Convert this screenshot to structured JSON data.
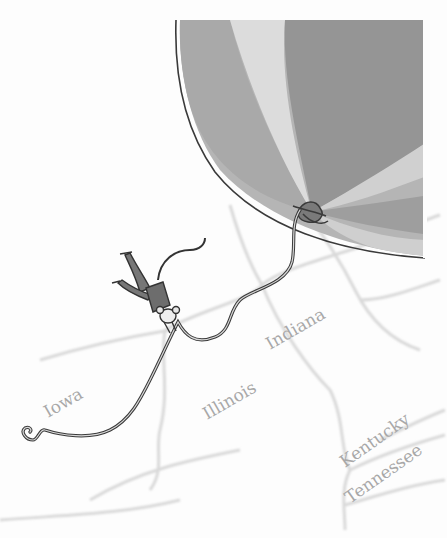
{
  "illustration": {
    "subject": "mouse hanging from a balloon string floating over a map",
    "colors": {
      "balloon_dark": "#8e8e8e",
      "balloon_mid": "#a9a9a9",
      "balloon_light": "#d2d2d2",
      "outline": "#3a3a3a",
      "map_line": "#d8d8d8",
      "label": "#a8a8a8"
    }
  },
  "map": {
    "labels": [
      {
        "name": "Iowa"
      },
      {
        "name": "Illinois"
      },
      {
        "name": "Indiana"
      },
      {
        "name": "Kentucky"
      },
      {
        "name": "Tennessee"
      }
    ]
  }
}
